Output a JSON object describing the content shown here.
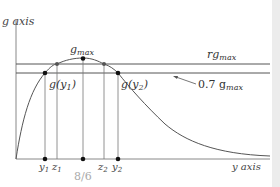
{
  "diagram": {
    "axes": {
      "y_label": "g axis",
      "x_label": "y axis"
    },
    "levels": {
      "upper_label_main": "rg",
      "upper_label_sub": "max",
      "lower_label_main": "0.7 g",
      "lower_label_sub": "max"
    },
    "peak": {
      "label_main": "g",
      "label_sub": "max"
    },
    "points": {
      "gy1_main": "g(y",
      "gy1_sub": "1",
      "gy1_close": ")",
      "gy2_main": "g(y",
      "gy2_sub": "2",
      "gy2_close": ")"
    },
    "ticks": [
      {
        "main": "y",
        "sub": "1"
      },
      {
        "main": "z",
        "sub": "1"
      },
      {
        "main": "z",
        "sub": "2"
      },
      {
        "main": "y",
        "sub": "2"
      }
    ],
    "center_label": "8/6",
    "colors": {
      "line": "#555555",
      "axis": "#888888",
      "text": "#333333",
      "faint_text": "#aaaaaa",
      "point": "#111111",
      "point_gray": "#555555"
    }
  }
}
